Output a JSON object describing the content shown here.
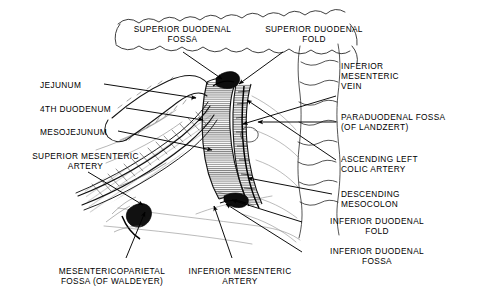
{
  "figure": {
    "background_color": "#ffffff",
    "ink_color": "#000000",
    "width": 480,
    "height": 305
  },
  "labels": {
    "superior_duodenal_fossa": "SUPERIOR DUODENAL\nFOSSA",
    "superior_duodenal_fold": "SUPERIOR DUODENAL\nFOLD",
    "jejunum": "JEJUNUM",
    "fourth_duodenum": "4TH DUODENUM",
    "mesojejunum": "MESOJEJUNUM",
    "superior_mesenteric_artery": "SUPERIOR MESENTERIC\nARTERY",
    "mesentericoparietal_fossa": "MESENTERICOPARIETAL\nFOSSA (OF WALDEYER)",
    "inferior_mesenteric_artery": "INFERIOR MESENTERIC\nARTERY",
    "inferior_mesenteric_vein": "INFERIOR\nMESENTERIC\nVEIN",
    "paraduodenal_fossa": "PARADUODENAL FOSSA\n(OF LANDZERT)",
    "ascending_left_colic_artery": "ASCENDING LEFT\nCOLIC ARTERY",
    "descending_mesocolon": "DESCENDING\nMESOCOLON",
    "inferior_duodenal_fold": "INFERIOR DUODENAL\nFOLD",
    "inferior_duodenal_fossa": "INFERIOR DUODENAL\nFOSSA"
  },
  "structures": {
    "transverse_colon": "transverse-colon-scalloped-band",
    "descending_colon": "descending-colon-outline",
    "duodenum_fourth_part": "fourth-part-duodenum-tube",
    "jejunum_loop": "jejunum-loop",
    "mesentery": "mesentery-hatched-fan",
    "vascular_strip": "inferior-mesenteric-vessels-strip"
  }
}
